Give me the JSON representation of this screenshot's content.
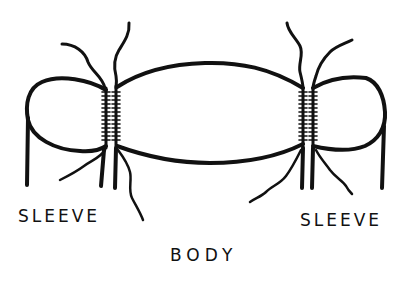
{
  "diagram": {
    "title": "",
    "labels": {
      "left_sleeve": "SLEEVE",
      "right_sleeve": "SLEEVE",
      "body": "BODY"
    },
    "parts": [
      {
        "id": "left-sleeve",
        "name": "Sleeve",
        "position": "left"
      },
      {
        "id": "body",
        "name": "Body",
        "position": "center"
      },
      {
        "id": "right-sleeve",
        "name": "Sleeve",
        "position": "right"
      }
    ],
    "seams": [
      {
        "id": "left-seam",
        "between": [
          "left-sleeve",
          "body"
        ]
      },
      {
        "id": "right-seam",
        "between": [
          "body",
          "right-sleeve"
        ]
      }
    ],
    "colors": {
      "ink": "#111111",
      "background": "#ffffff"
    }
  }
}
